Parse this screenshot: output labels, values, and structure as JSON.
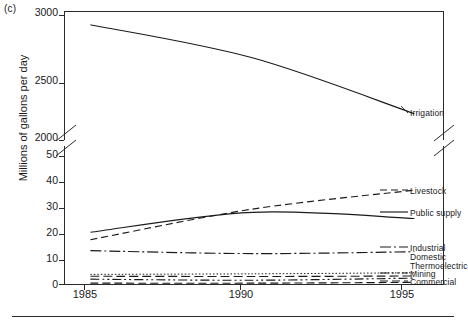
{
  "figure": {
    "panel_label": "(c)",
    "footer_rule": true
  },
  "chart_data": {
    "type": "line",
    "title": "",
    "xlabel": "",
    "ylabel": "Millions of gallons per day",
    "x": [
      1985,
      1990,
      1995
    ],
    "xtick_labels": [
      "1985",
      "1990",
      "1995"
    ],
    "xlim": [
      1984.2,
      1995.9
    ],
    "axis_break": {
      "present": true,
      "between": [
        2000,
        50
      ],
      "note": "broken y-axis with double-slash marks on left and right spines"
    },
    "y_axis_lower": {
      "ticks": [
        0,
        10,
        20,
        30,
        40,
        50
      ],
      "tick_labels": [
        "0",
        "10",
        "20",
        "30",
        "40",
        "50"
      ],
      "ylim": [
        0,
        52
      ]
    },
    "y_axis_upper": {
      "ticks": [
        2000,
        2500,
        3000
      ],
      "tick_labels": [
        "2000",
        "2500",
        "3000"
      ],
      "ylim": [
        1950,
        3080
      ]
    },
    "grid": false,
    "legend_position": "right-inline-labels",
    "series": [
      {
        "name": "Irrigation",
        "label": "Irrigation",
        "axis": "upper",
        "values": [
          2960,
          2670,
          2180
        ],
        "style": "solid",
        "dash": "none",
        "color": "#1a1a1a"
      },
      {
        "name": "Livestock",
        "label": "Livestock",
        "axis": "lower",
        "values": [
          16.8,
          28.3,
          35.4
        ],
        "style": "dashed",
        "dash": "7,4",
        "color": "#1a1a1a"
      },
      {
        "name": "Public supply",
        "label": "Public supply",
        "axis": "lower",
        "values": [
          19.6,
          27.1,
          24.8
        ],
        "style": "solid",
        "dash": "none",
        "color": "#1a1a1a"
      },
      {
        "name": "Industrial",
        "label": "Industrial",
        "axis": "lower",
        "values": [
          12.7,
          11.6,
          12.3
        ],
        "style": "dash-dot",
        "dash": "11,3,2,3",
        "color": "#1a1a1a"
      },
      {
        "name": "Domestic",
        "label": "Domestic",
        "axis": "lower",
        "values": [
          3.8,
          4.0,
          4.4
        ],
        "style": "dotted",
        "dash": "1.5,2",
        "color": "#1a1a1a"
      },
      {
        "name": "Thermoelectric",
        "label": "Thermoelectric",
        "axis": "lower",
        "values": [
          3.1,
          3.0,
          3.2
        ],
        "style": "long-dash",
        "dash": "9,4",
        "color": "#1a1a1a"
      },
      {
        "name": "Mining",
        "label": "Mining",
        "axis": "lower",
        "values": [
          2.0,
          1.6,
          2.4
        ],
        "style": "dash-dot-dot",
        "dash": "9,3,2,3,2,3",
        "color": "#1a1a1a"
      },
      {
        "name": "Commercial",
        "label": "Commercial",
        "axis": "lower",
        "values": [
          0.5,
          0.5,
          0.8
        ],
        "style": "dashed-thin",
        "dash": "8,4",
        "color": "#1a1a1a"
      }
    ]
  }
}
